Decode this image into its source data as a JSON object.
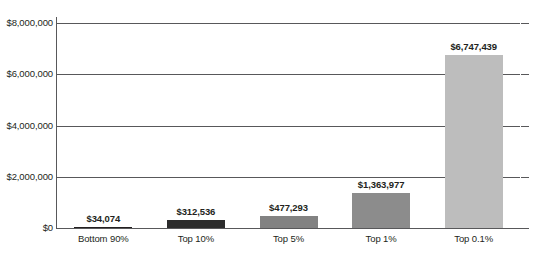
{
  "chart_data": {
    "type": "bar",
    "title": "",
    "subtitle": "",
    "xlabel": "",
    "ylabel": "",
    "categories": [
      "Bottom 90%",
      "Top 10%",
      "Top 5%",
      "Top 1%",
      "Top 0.1%"
    ],
    "values": [
      34074,
      312536,
      477293,
      1363977,
      6747439
    ],
    "value_labels": [
      "$34,074",
      "$312,536",
      "$477,293",
      "$1,363,977",
      "$6,747,439"
    ],
    "ylim": [
      0,
      8000000
    ],
    "ytick_values": [
      0,
      2000000,
      4000000,
      6000000,
      8000000
    ],
    "ytick_labels": [
      "$0",
      "$2,000,000",
      "$4,000,000",
      "$6,000,000",
      "$8,000,000"
    ],
    "grid": "horizontal",
    "legend": "none",
    "series": [
      {
        "name": "Average income",
        "values": [
          34074,
          312536,
          477293,
          1363977,
          6747439
        ]
      }
    ],
    "bar_colors": [
      "#231f20",
      "#2c2c2c",
      "#828282",
      "#8c8c8c",
      "#bdbdbd"
    ]
  },
  "axis": {
    "line_color": "#58585a",
    "grid_color": "#58585a",
    "text_color": "#231f20"
  }
}
